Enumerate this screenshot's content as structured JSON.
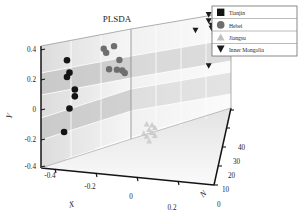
{
  "chart_data": {
    "type": "scatter",
    "title": "PLSDA",
    "projection": "3d",
    "xlabel": "X",
    "ylabel": "Y",
    "zlabel": "N",
    "xticks": [
      "-0.4",
      "-0.2",
      "0",
      "0.2"
    ],
    "yticks": [
      "0.4",
      "0.2",
      "0",
      "-0.2",
      "-0.4"
    ],
    "zticks": [
      "0",
      "10",
      "20",
      "30",
      "40"
    ],
    "xlim": [
      -0.4,
      0.3
    ],
    "ylim": [
      -0.4,
      0.4
    ],
    "zlim": [
      0,
      40
    ],
    "grid": true,
    "legend_position": "top-right",
    "colors": {
      "tianjin": "#141414",
      "hebei": "#6e6e6e",
      "jiangsu": "#c9c9c9",
      "inner_mongolia": "#1b1b1b",
      "axis": "#1a1a1a",
      "panel_light": "#f3f3f3",
      "panel_mid": "#d9d9d9",
      "panel_dark": "#c2c2c2",
      "grid_line": "#ffffff"
    },
    "series": [
      {
        "name": "Tianjin",
        "marker": "square",
        "color": "#141414",
        "points": [
          {
            "x": -0.3,
            "y": 0.285,
            "n": 3
          },
          {
            "x": -0.29,
            "y": 0.205,
            "n": 3
          },
          {
            "x": -0.3,
            "y": 0.175,
            "n": 3
          },
          {
            "x": -0.27,
            "y": 0.085,
            "n": 4
          },
          {
            "x": -0.27,
            "y": 0.04,
            "n": 4
          },
          {
            "x": -0.29,
            "y": -0.03,
            "n": 3
          },
          {
            "x": -0.31,
            "y": -0.175,
            "n": 2
          }
        ]
      },
      {
        "name": "Hebei",
        "marker": "circle",
        "color": "#6e6e6e",
        "points": [
          {
            "x": -0.16,
            "y": 0.32,
            "n": 8
          },
          {
            "x": -0.12,
            "y": 0.33,
            "n": 9
          },
          {
            "x": -0.15,
            "y": 0.295,
            "n": 8
          },
          {
            "x": -0.1,
            "y": 0.23,
            "n": 10
          },
          {
            "x": -0.14,
            "y": 0.175,
            "n": 9
          },
          {
            "x": -0.11,
            "y": 0.165,
            "n": 10
          },
          {
            "x": -0.09,
            "y": 0.15,
            "n": 11
          },
          {
            "x": -0.08,
            "y": 0.135,
            "n": 11
          }
        ]
      },
      {
        "name": "Jiangsu",
        "marker": "triangle-up",
        "color": "#c9c9c9",
        "points": [
          {
            "x": 0.0,
            "y": -0.25,
            "n": 16
          },
          {
            "x": 0.02,
            "y": -0.265,
            "n": 17
          },
          {
            "x": 0.01,
            "y": -0.285,
            "n": 16
          },
          {
            "x": 0.03,
            "y": -0.295,
            "n": 18
          },
          {
            "x": -0.01,
            "y": -0.3,
            "n": 15
          },
          {
            "x": 0.02,
            "y": -0.315,
            "n": 17
          },
          {
            "x": 0.0,
            "y": -0.33,
            "n": 16
          },
          {
            "x": 0.03,
            "y": -0.345,
            "n": 18
          },
          {
            "x": 0.01,
            "y": -0.36,
            "n": 16
          }
        ]
      },
      {
        "name": "Inner Mongolia",
        "marker": "triangle-down",
        "color": "#1b1b1b",
        "points": [
          {
            "x": 0.22,
            "y": 0.275,
            "n": 34
          },
          {
            "x": 0.22,
            "y": 0.235,
            "n": 34
          },
          {
            "x": 0.17,
            "y": 0.19,
            "n": 32
          },
          {
            "x": 0.23,
            "y": 0.195,
            "n": 35
          },
          {
            "x": 0.23,
            "y": 0.175,
            "n": 35
          },
          {
            "x": 0.24,
            "y": 0.15,
            "n": 36
          },
          {
            "x": 0.25,
            "y": 0.13,
            "n": 36
          },
          {
            "x": 0.24,
            "y": 0.115,
            "n": 36
          },
          {
            "x": 0.22,
            "y": -0.06,
            "n": 34
          }
        ]
      }
    ]
  },
  "legend": {
    "items": [
      {
        "label": "Tianjin",
        "marker": "square"
      },
      {
        "label": "Hebei",
        "marker": "circle"
      },
      {
        "label": "Jiangsu",
        "marker": "triangle-up"
      },
      {
        "label": "Inner Mongolia",
        "marker": "triangle-down"
      }
    ]
  }
}
